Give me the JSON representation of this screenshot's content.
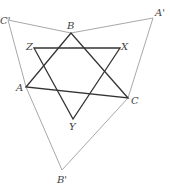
{
  "diagram": {
    "points": {
      "C_prime": {
        "label": "C'",
        "x": 8,
        "y": 20
      },
      "A_prime": {
        "label": "A'",
        "x": 153,
        "y": 18
      },
      "B_prime": {
        "label": "B'",
        "x": 62,
        "y": 170
      },
      "B": {
        "label": "B",
        "x": 71,
        "y": 33
      },
      "A": {
        "label": "A",
        "x": 26,
        "y": 87
      },
      "C": {
        "label": "C",
        "x": 128,
        "y": 98
      },
      "Z": {
        "label": "Z",
        "x": 34,
        "y": 48
      },
      "X": {
        "label": "X",
        "x": 120,
        "y": 48
      },
      "Y": {
        "label": "Y",
        "x": 73,
        "y": 119
      }
    },
    "colors": {
      "outer": "#a0a0a0",
      "inner": "#333333"
    }
  }
}
